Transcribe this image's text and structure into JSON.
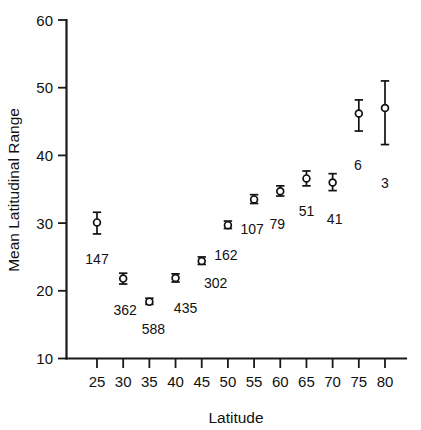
{
  "chart_data": {
    "type": "scatter",
    "title": "",
    "xlabel": "Latitude",
    "ylabel": "Mean Latitudinal Range",
    "xlim": [
      22.5,
      82.5
    ],
    "ylim": [
      10,
      60
    ],
    "xticks": [
      25,
      30,
      35,
      40,
      45,
      50,
      55,
      60,
      65,
      70,
      75,
      80
    ],
    "yticks": [
      10,
      20,
      30,
      40,
      50,
      60
    ],
    "xtick_labels": [
      "25",
      "30",
      "35",
      "40",
      "45",
      "50",
      "55",
      "60",
      "65",
      "70",
      "75",
      "80"
    ],
    "ytick_labels": [
      "10",
      "20",
      "30",
      "40",
      "50",
      "60"
    ],
    "grid": false,
    "legend": "none",
    "marker_style": "open-circle-with-error-bars",
    "annotation_note": "Number beside each point is the sample size (n)",
    "x": [
      25,
      30,
      35,
      40,
      45,
      50,
      55,
      60,
      65,
      70,
      75,
      80
    ],
    "values": [
      30.1,
      21.8,
      18.4,
      21.9,
      24.4,
      29.7,
      33.5,
      34.7,
      36.6,
      36.0,
      46.2,
      47.0
    ],
    "err_low": [
      28.4,
      21.0,
      18.0,
      21.3,
      23.9,
      29.2,
      32.9,
      34.0,
      35.5,
      34.8,
      43.6,
      41.6
    ],
    "err_high": [
      31.6,
      22.6,
      18.9,
      22.5,
      25.0,
      30.3,
      34.2,
      35.5,
      37.7,
      37.3,
      48.2,
      51.0
    ],
    "point_labels": [
      "147",
      "362",
      "588",
      "435",
      "302",
      "162",
      "107",
      "79",
      "51",
      "41",
      "6",
      "3"
    ],
    "label_offsets": [
      {
        "dx": 0,
        "dy": 30
      },
      {
        "dx": 2,
        "dy": 31
      },
      {
        "dx": 4,
        "dy": 30
      },
      {
        "dx": 10,
        "dy": 31
      },
      {
        "dx": 14,
        "dy": 24
      },
      {
        "dx": -2,
        "dy": 31
      },
      {
        "dx": -2,
        "dy": 31
      },
      {
        "dx": -3,
        "dy": 33
      },
      {
        "dx": 0,
        "dy": 30
      },
      {
        "dx": 2,
        "dy": 33
      },
      {
        "dx": -1,
        "dy": 39
      },
      {
        "dx": 0,
        "dy": 43
      }
    ]
  },
  "figure": {
    "background_color": "#ffffff",
    "axis_color": "#1a1a1a",
    "marker_fill": "#ffffff",
    "marker_stroke": "#111111"
  }
}
